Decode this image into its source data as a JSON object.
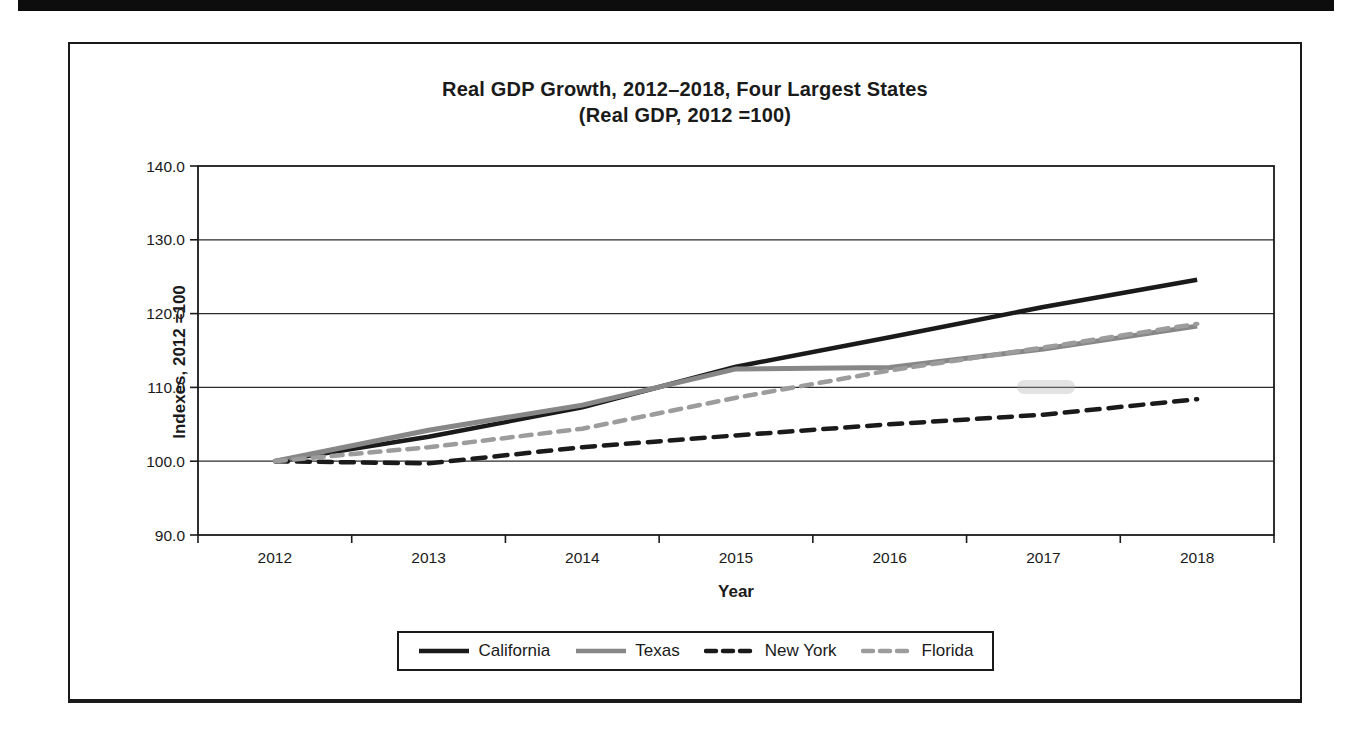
{
  "chart_data": {
    "type": "line",
    "title": "Real GDP Growth, 2012–2018, Four Largest States",
    "subtitle": "(Real GDP, 2012 =100)",
    "xlabel": "Year",
    "ylabel": "Indexes, 2012 =100",
    "categories": [
      "2012",
      "2013",
      "2014",
      "2015",
      "2016",
      "2017",
      "2018"
    ],
    "ylim": [
      90,
      140
    ],
    "ytick_interval": 10,
    "y_tick_labels": [
      "140.0",
      "130.0",
      "120.0",
      "110.0",
      "100.0",
      "90.0"
    ],
    "grid": "horizontal",
    "legend_position": "bottom",
    "series": [
      {
        "name": "California",
        "color": "#1a1a1a",
        "style": "solid",
        "values": [
          100.0,
          103.3,
          107.3,
          112.8,
          116.8,
          120.9,
          124.6
        ]
      },
      {
        "name": "Texas",
        "color": "#878787",
        "style": "solid",
        "values": [
          100.0,
          104.2,
          107.6,
          112.5,
          112.7,
          115.2,
          118.3
        ]
      },
      {
        "name": "New York",
        "color": "#1a1a1a",
        "style": "dashed",
        "values": [
          100.0,
          99.7,
          101.9,
          103.5,
          105.0,
          106.3,
          108.4
        ]
      },
      {
        "name": "Florida",
        "color": "#9c9c9c",
        "style": "dashed",
        "values": [
          100.0,
          101.9,
          104.4,
          108.6,
          112.3,
          115.4,
          118.6
        ]
      }
    ]
  }
}
